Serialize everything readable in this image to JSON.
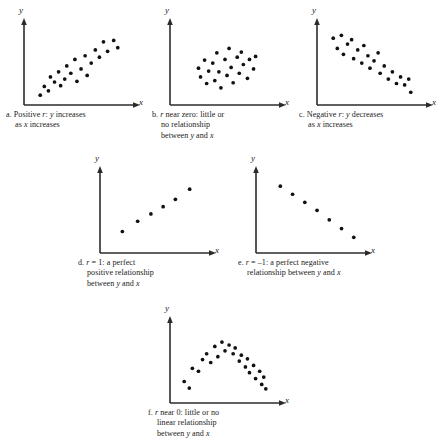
{
  "figure": {
    "title": "",
    "axis_label_y": "y",
    "axis_label_x": "x"
  },
  "panels": [
    {
      "id": "a",
      "caption_lines": [
        "a. Positive r: y increases",
        "as x increases"
      ],
      "caption_plain": "a. Positive r: y increases as x increases",
      "label": "a",
      "r_description": "Positive r",
      "relationship": "y increases as x increases"
    },
    {
      "id": "b",
      "caption_lines": [
        "b. r near zero: little or",
        "no relationship",
        "between y and x"
      ],
      "caption_plain": "b. r near zero: little or no relationship between y and x",
      "label": "b",
      "r_description": "r near zero",
      "relationship": "little or no relationship between y and x"
    },
    {
      "id": "c",
      "caption_lines": [
        "c. Negative r: y decreases",
        "as x increases"
      ],
      "caption_plain": "c. Negative r: y decreases as x increases",
      "label": "c",
      "r_description": "Negative r",
      "relationship": "y decreases as x increases"
    },
    {
      "id": "d",
      "caption_lines": [
        "d.  r = 1: a perfect",
        "positive relationship",
        "between y and x"
      ],
      "caption_plain": "d. r = 1: a perfect positive relationship between y and x",
      "label": "d",
      "r_description": "r = 1",
      "relationship": "a perfect positive relationship between y and x"
    },
    {
      "id": "e",
      "caption_lines": [
        "e.  r = –1: a perfect negative",
        "relationship between y and x"
      ],
      "caption_plain": "e. r = -1: a perfect negative relationship between y and x",
      "label": "e",
      "r_description": "r = –1",
      "relationship": "a perfect negative relationship between y and x"
    },
    {
      "id": "f",
      "caption_lines": [
        "f.  r near 0: little or no",
        "linear relationship",
        "between y and x"
      ],
      "caption_plain": "f. r near 0: little or no linear relationship between y and x",
      "label": "f",
      "r_description": "r near 0",
      "relationship": "little or no linear relationship between y and x"
    }
  ],
  "chart_data": [
    {
      "type": "scatter",
      "panel": "a",
      "title": "a. Positive r: y increases as x increases",
      "xlabel": "x",
      "ylabel": "y",
      "xlim": [
        0,
        100
      ],
      "ylim": [
        0,
        100
      ],
      "grid": false,
      "legend": "none",
      "correlation": "positive",
      "n_points": 22,
      "points": [
        [
          12,
          8
        ],
        [
          16,
          20
        ],
        [
          20,
          14
        ],
        [
          22,
          33
        ],
        [
          26,
          26
        ],
        [
          30,
          40
        ],
        [
          32,
          21
        ],
        [
          36,
          30
        ],
        [
          38,
          48
        ],
        [
          42,
          38
        ],
        [
          46,
          57
        ],
        [
          48,
          27
        ],
        [
          52,
          44
        ],
        [
          56,
          62
        ],
        [
          58,
          35
        ],
        [
          62,
          52
        ],
        [
          66,
          70
        ],
        [
          70,
          60
        ],
        [
          74,
          81
        ],
        [
          78,
          68
        ],
        [
          84,
          83
        ],
        [
          88,
          73
        ]
      ]
    },
    {
      "type": "scatter",
      "panel": "b",
      "title": "b. r near zero: little or no relationship between y and x",
      "xlabel": "x",
      "ylabel": "y",
      "xlim": [
        0,
        100
      ],
      "ylim": [
        0,
        100
      ],
      "grid": false,
      "legend": "none",
      "correlation": "near zero",
      "n_points": 23,
      "points": [
        [
          24,
          45
        ],
        [
          26,
          33
        ],
        [
          30,
          56
        ],
        [
          32,
          24
        ],
        [
          34,
          41
        ],
        [
          38,
          52
        ],
        [
          40,
          28
        ],
        [
          42,
          66
        ],
        [
          44,
          40
        ],
        [
          46,
          18
        ],
        [
          50,
          57
        ],
        [
          52,
          35
        ],
        [
          54,
          72
        ],
        [
          56,
          46
        ],
        [
          58,
          25
        ],
        [
          62,
          60
        ],
        [
          64,
          38
        ],
        [
          66,
          67
        ],
        [
          68,
          50
        ],
        [
          72,
          31
        ],
        [
          74,
          57
        ],
        [
          78,
          44
        ],
        [
          80,
          61
        ]
      ]
    },
    {
      "type": "scatter",
      "panel": "c",
      "title": "c. Negative r: y decreases as x increases",
      "xlabel": "x",
      "ylabel": "y",
      "xlim": [
        0,
        100
      ],
      "ylim": [
        0,
        100
      ],
      "grid": false,
      "legend": "none",
      "correlation": "negative",
      "n_points": 23,
      "points": [
        [
          12,
          86
        ],
        [
          16,
          72
        ],
        [
          20,
          90
        ],
        [
          22,
          64
        ],
        [
          26,
          78
        ],
        [
          30,
          84
        ],
        [
          32,
          58
        ],
        [
          36,
          70
        ],
        [
          40,
          52
        ],
        [
          42,
          76
        ],
        [
          46,
          62
        ],
        [
          48,
          45
        ],
        [
          52,
          55
        ],
        [
          56,
          66
        ],
        [
          58,
          38
        ],
        [
          62,
          48
        ],
        [
          66,
          30
        ],
        [
          70,
          40
        ],
        [
          74,
          24
        ],
        [
          78,
          33
        ],
        [
          82,
          22
        ],
        [
          86,
          30
        ],
        [
          88,
          12
        ]
      ]
    },
    {
      "type": "scatter",
      "panel": "d",
      "title": "d. r = 1: a perfect positive relationship between y and x",
      "xlabel": "x",
      "ylabel": "y",
      "xlim": [
        0,
        100
      ],
      "ylim": [
        0,
        100
      ],
      "grid": false,
      "legend": "none",
      "correlation": "r = 1",
      "n_points": 6,
      "points": [
        [
          18,
          24
        ],
        [
          33,
          38
        ],
        [
          46,
          48
        ],
        [
          58,
          58
        ],
        [
          70,
          68
        ],
        [
          84,
          82
        ]
      ]
    },
    {
      "type": "scatter",
      "panel": "e",
      "title": "e. r = -1: a perfect negative relationship between y and x",
      "xlabel": "x",
      "ylabel": "y",
      "xlim": [
        0,
        100
      ],
      "ylim": [
        0,
        100
      ],
      "grid": false,
      "legend": "none",
      "correlation": "r = -1",
      "n_points": 7,
      "points": [
        [
          16,
          86
        ],
        [
          28,
          75
        ],
        [
          40,
          64
        ],
        [
          52,
          53
        ],
        [
          64,
          40
        ],
        [
          76,
          28
        ],
        [
          88,
          16
        ]
      ]
    },
    {
      "type": "scatter",
      "panel": "f",
      "title": "f. r near 0: little or no linear relationship between y and x",
      "xlabel": "x",
      "ylabel": "y",
      "xlim": [
        0,
        100
      ],
      "ylim": [
        0,
        100
      ],
      "grid": false,
      "legend": "none",
      "correlation": "near zero (curved)",
      "n_points": 25,
      "points": [
        [
          10,
          24
        ],
        [
          15,
          15
        ],
        [
          18,
          42
        ],
        [
          24,
          38
        ],
        [
          28,
          54
        ],
        [
          32,
          62
        ],
        [
          36,
          50
        ],
        [
          40,
          72
        ],
        [
          43,
          58
        ],
        [
          47,
          78
        ],
        [
          50,
          66
        ],
        [
          54,
          74
        ],
        [
          58,
          62
        ],
        [
          60,
          70
        ],
        [
          64,
          52
        ],
        [
          66,
          60
        ],
        [
          70,
          44
        ],
        [
          72,
          55
        ],
        [
          74,
          36
        ],
        [
          78,
          46
        ],
        [
          80,
          28
        ],
        [
          84,
          38
        ],
        [
          86,
          20
        ],
        [
          88,
          30
        ],
        [
          90,
          14
        ]
      ]
    }
  ]
}
